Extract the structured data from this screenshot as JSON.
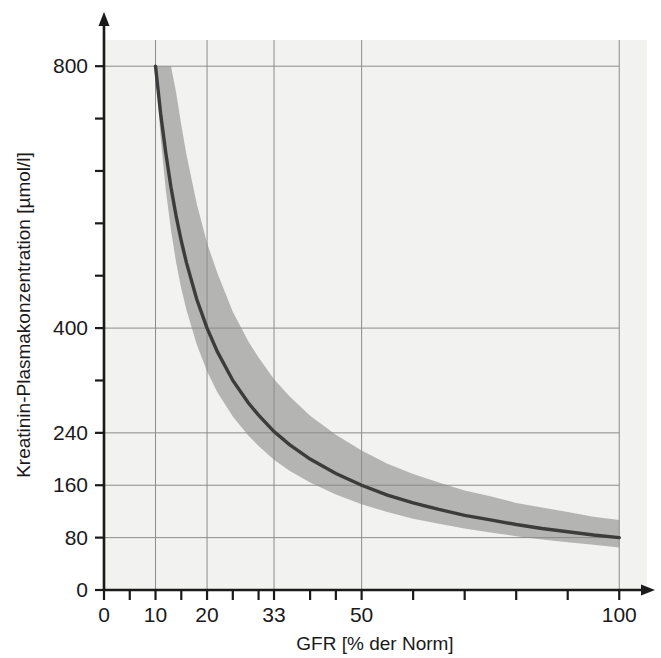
{
  "chart_data": {
    "type": "line",
    "title": "",
    "xlabel": "GFR [% der Norm]",
    "ylabel": "Kreatinin-Plasmakonzentration [µmol/l]",
    "xlim": [
      0,
      105
    ],
    "ylim": [
      0,
      840
    ],
    "grid": true,
    "legend_position": "none",
    "x_ticks_labeled": [
      0,
      10,
      20,
      33,
      50,
      100
    ],
    "x_tick_labels": [
      "0",
      "10",
      "20",
      "33",
      "50",
      "100"
    ],
    "x_ticks_minor": [
      5,
      15,
      25,
      30,
      40,
      45,
      60,
      70,
      80,
      90
    ],
    "y_ticks_labeled": [
      0,
      80,
      160,
      240,
      400,
      800
    ],
    "y_tick_labels": [
      "0",
      "80",
      "160",
      "240",
      "400",
      "800"
    ],
    "y_ticks_minor": [
      320,
      480,
      560,
      640,
      720
    ],
    "gridlines_x": [
      10,
      20,
      33,
      50,
      100
    ],
    "gridlines_y": [
      80,
      160,
      240,
      400,
      800
    ],
    "series": [
      {
        "name": "Kreatinin-Plasmakonzentration (Mittelwert)",
        "relation": "Kreatinin = 8000 / GFR",
        "color": "#3c3c3c",
        "x": [
          10,
          11,
          12,
          13,
          14,
          15,
          16,
          18,
          20,
          22,
          25,
          28,
          30,
          33,
          36,
          40,
          45,
          50,
          55,
          60,
          65,
          70,
          75,
          80,
          85,
          90,
          95,
          100
        ],
        "values": [
          800,
          727,
          667,
          615,
          571,
          533,
          500,
          444,
          400,
          364,
          320,
          286,
          267,
          242,
          222,
          200,
          178,
          160,
          145,
          133,
          123,
          114,
          107,
          100,
          94,
          89,
          84,
          80
        ]
      },
      {
        "name": "Streubereich obere Grenze",
        "kind": "band-upper",
        "color": "#b0b0ae",
        "x": [
          13,
          14,
          15,
          16,
          18,
          20,
          22,
          25,
          28,
          30,
          33,
          36,
          40,
          45,
          50,
          55,
          60,
          65,
          70,
          75,
          80,
          85,
          90,
          95,
          100
        ],
        "values": [
          800,
          760,
          710,
          665,
          590,
          530,
          484,
          425,
          380,
          355,
          322,
          296,
          266,
          237,
          213,
          193,
          177,
          164,
          152,
          143,
          133,
          126,
          119,
          112,
          107
        ]
      },
      {
        "name": "Streubereich untere Grenze",
        "kind": "band-lower",
        "color": "#b0b0ae",
        "x": [
          10,
          11,
          12,
          13,
          14,
          15,
          16,
          18,
          20,
          22,
          25,
          28,
          30,
          33,
          36,
          40,
          45,
          50,
          55,
          60,
          65,
          70,
          75,
          80,
          85,
          90,
          95,
          100
        ],
        "values": [
          800,
          690,
          610,
          550,
          500,
          460,
          428,
          375,
          334,
          302,
          265,
          236,
          220,
          199,
          182,
          164,
          146,
          131,
          119,
          109,
          101,
          94,
          88,
          82,
          77,
          73,
          69,
          65
        ]
      }
    ],
    "annotations": [],
    "colors": {
      "curve": "#3c3c3c",
      "band": "#b0b0ae",
      "plot_background": "#f2f2f0",
      "axis": "#1a1a1a",
      "gridline": "#8c8c8c",
      "page_background": "#ffffff"
    }
  }
}
